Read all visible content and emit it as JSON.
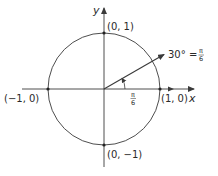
{
  "diagram": {
    "type": "unit-circle",
    "axes": {
      "x_label": "x",
      "y_label": "y"
    },
    "points": [
      {
        "label": "(0, 1)",
        "coord": [
          0,
          1
        ]
      },
      {
        "label": "(1, 0)",
        "coord": [
          1,
          0
        ]
      },
      {
        "label": "(−1, 0)",
        "coord": [
          -1,
          0
        ]
      },
      {
        "label": "(0, −1)",
        "coord": [
          0,
          -1
        ]
      }
    ],
    "angle": {
      "label_left": "30° =",
      "frac_num": "π",
      "frac_den": "6",
      "arc_label_num": "π",
      "arc_label_den": "6",
      "degrees": 30
    },
    "colors": {
      "stroke": "#3a3a3a",
      "text": "#2a2a2a",
      "background": "#ffffff"
    }
  }
}
